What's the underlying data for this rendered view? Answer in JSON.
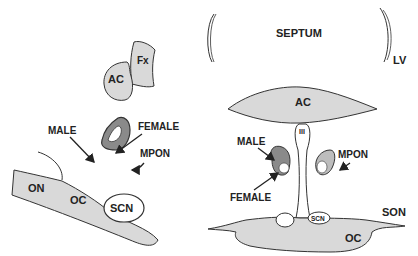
{
  "colors": {
    "outline": "#333333",
    "light_fill": "#d9d9d9",
    "dark_fill": "#8a8a8a",
    "background": "#ffffff"
  },
  "left_panel": {
    "labels": {
      "ac": "AC",
      "fx": "Fx",
      "male": "MALE",
      "female": "FEMALE",
      "mpon": "MPON",
      "on": "ON",
      "oc": "OC",
      "scn": "SCN"
    }
  },
  "right_panel": {
    "labels": {
      "septum": "SEPTUM",
      "lv": "LV",
      "ac": "AC",
      "third_ventricle": "III",
      "male": "MALE",
      "female": "FEMALE",
      "mpon": "MPON",
      "son": "SON",
      "scn": "SCN",
      "oc": "OC"
    }
  }
}
